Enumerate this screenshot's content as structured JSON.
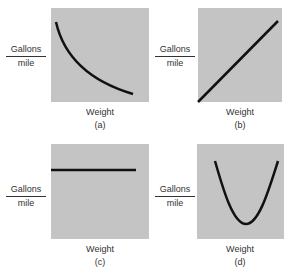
{
  "figure": {
    "panels": [
      {
        "id": "a",
        "caption": "(a)",
        "y_numerator": "Gallons",
        "y_denominator": "mile",
        "x_label": "Weight",
        "shape": "decreasing convex curve"
      },
      {
        "id": "b",
        "caption": "(b)",
        "y_numerator": "Gallons",
        "y_denominator": "mile",
        "x_label": "Weight",
        "shape": "increasing straight line"
      },
      {
        "id": "c",
        "caption": "(c)",
        "y_numerator": "Gallons",
        "y_denominator": "mile",
        "x_label": "Weight",
        "shape": "horizontal flat line"
      },
      {
        "id": "d",
        "caption": "(d)",
        "y_numerator": "Gallons",
        "y_denominator": "mile",
        "x_label": "Weight",
        "shape": "U-shaped curve"
      }
    ],
    "colors": {
      "plot_bg": "#c4c4c4",
      "line": "#111111",
      "text": "#333333"
    }
  }
}
